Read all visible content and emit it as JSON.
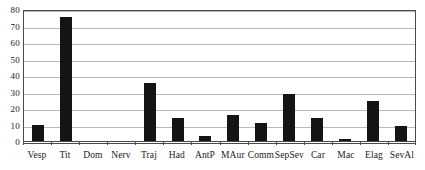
{
  "chart_data": {
    "type": "bar",
    "title": "",
    "subtitle": "",
    "xlabel": "",
    "ylabel": "",
    "ylim": [
      0,
      80
    ],
    "yticks": [
      0,
      10,
      20,
      30,
      40,
      50,
      60,
      70,
      80
    ],
    "grid": true,
    "legend": false,
    "legend_position": "none",
    "bar_color": "#141414",
    "categories": [
      "Vesp",
      "Tit",
      "Dom",
      "Nerv",
      "Traj",
      "Had",
      "AntP",
      "MAur",
      "Comm",
      "SepSev",
      "Car",
      "Mac",
      "Elag",
      "SevAl"
    ],
    "values": [
      9.5,
      75,
      0,
      0,
      35,
      14,
      3,
      16,
      11,
      28.5,
      14,
      1,
      24,
      9
    ],
    "series": [
      {
        "name": "",
        "values": [
          9.5,
          75,
          0,
          0,
          35,
          14,
          3,
          16,
          11,
          28.5,
          14,
          1,
          24,
          9
        ]
      }
    ]
  }
}
